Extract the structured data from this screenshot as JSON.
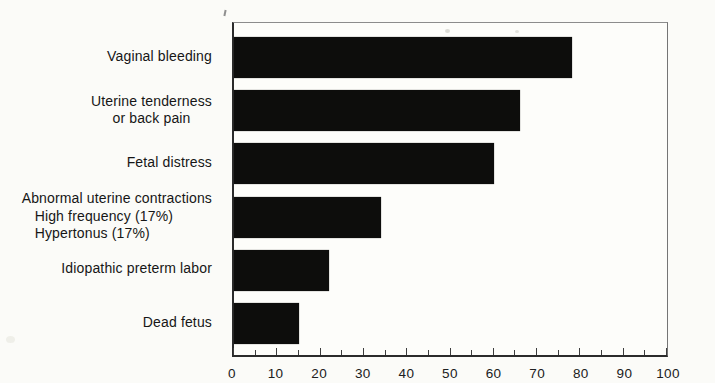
{
  "chart_data": {
    "type": "bar",
    "orientation": "horizontal",
    "title": "",
    "xlabel": "",
    "ylabel": "",
    "xlim": [
      0,
      100
    ],
    "x_major_ticks": [
      0,
      10,
      20,
      30,
      40,
      50,
      60,
      70,
      80,
      90,
      100
    ],
    "x_minor_tick_step": 5,
    "grid": false,
    "legend": false,
    "bar_color": "#0d0d0c",
    "categories": [
      "Vaginal bleeding",
      "Uterine tenderness or back pain",
      "Fetal distress",
      "Abnormal uterine contractions: High frequency (17%), Hypertonus (17%)",
      "Idiopathic preterm labor",
      "Dead fetus"
    ],
    "values": [
      78,
      66,
      60,
      34,
      22,
      15
    ],
    "bars": [
      {
        "label_lines": [
          "Vaginal bleeding"
        ],
        "value": 78
      },
      {
        "label_lines": [
          "Uterine tenderness",
          "or back pain"
        ],
        "value": 66
      },
      {
        "label_lines": [
          "Fetal distress"
        ],
        "value": 60
      },
      {
        "label_lines": [
          "Abnormal uterine contractions",
          "High frequency (17%)",
          "Hypertonus (17%)"
        ],
        "value": 34
      },
      {
        "label_lines": [
          "Idiopathic preterm labor"
        ],
        "value": 22
      },
      {
        "label_lines": [
          "Dead fetus"
        ],
        "value": 15
      }
    ]
  }
}
